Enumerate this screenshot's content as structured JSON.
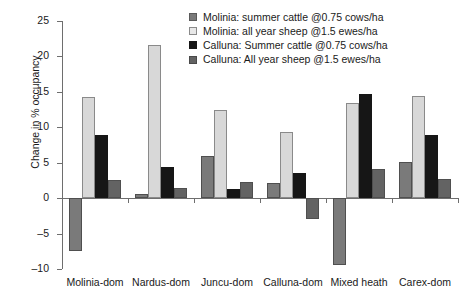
{
  "chart_data": {
    "type": "bar",
    "title": "",
    "subtitle": "",
    "xlabel": "",
    "ylabel": "Change in % occupancy",
    "ylim": [
      -10,
      25
    ],
    "ytick_labels": [
      "25",
      "20",
      "15",
      "10",
      "5",
      "0",
      "–5",
      "–10"
    ],
    "ytick_values": [
      25,
      20,
      15,
      10,
      5,
      0,
      -5,
      -10
    ],
    "grid": false,
    "legend_position": "top-right",
    "categories": [
      "Molinia-dom",
      "Nardus-dom",
      "Juncu-dom",
      "Calluna-dom",
      "Mixed heath",
      "Carex-dom"
    ],
    "series": [
      {
        "name": "Molinia: summer cattle @0.75 cows/ha",
        "color": "#7a7a7a",
        "values": [
          -7.5,
          0.6,
          5.9,
          2.1,
          -9.5,
          5.1
        ]
      },
      {
        "name": "Molinia: all year sheep @1.5 ewes/ha",
        "color": "#d4d4d4",
        "values": [
          14.3,
          21.6,
          12.4,
          9.3,
          13.4,
          14.4
        ]
      },
      {
        "name": "Calluna: Summer cattle @0.75 cows/ha",
        "color": "#161616",
        "values": [
          8.9,
          4.4,
          1.3,
          3.6,
          14.7,
          8.9
        ]
      },
      {
        "name": "Calluna: All year sheep @1.5 ewes/ha",
        "color": "#636363",
        "values": [
          2.5,
          1.4,
          2.3,
          -3.0,
          4.1,
          2.7
        ]
      }
    ]
  },
  "legend": {
    "items": [
      {
        "label": "Molinia: summer cattle @0.75 cows/ha",
        "color": "#7a7a7a",
        "border": "#5a5a5a"
      },
      {
        "label": "Molinia: all year sheep @1.5 ewes/ha",
        "color": "#e8e8e8",
        "border": "#8a8a8a"
      },
      {
        "label": "Calluna: Summer cattle @0.75 cows/ha",
        "color": "#161616",
        "border": "#161616"
      },
      {
        "label": "Calluna: All year sheep @1.5 ewes/ha",
        "color": "#636363",
        "border": "#4a4a4a"
      }
    ]
  },
  "axis": {
    "label_y": "Change in % occupancy"
  }
}
